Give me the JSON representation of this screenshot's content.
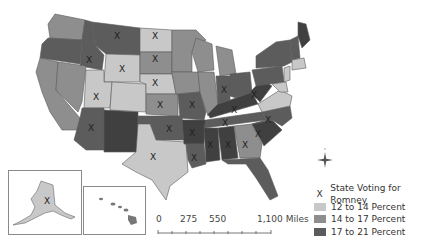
{
  "map": {
    "type": "choropleth",
    "subject": "US states by percent, with states voting for Romney marked X",
    "colors": {
      "c12_14": "#c8c8c8",
      "c14_17": "#8e8e8e",
      "c17_21": "#5c5c5c"
    },
    "x_marker": "X"
  },
  "legend": {
    "items": [
      {
        "symbol": "X",
        "label": "State Voting for Romney"
      },
      {
        "swatch": "#c8c8c8",
        "label": "12 to 14 Percent"
      },
      {
        "swatch": "#8e8e8e",
        "label": "14 to 17 Percent"
      },
      {
        "swatch": "#5c5c5c",
        "label": "17 to 21 Percent"
      }
    ]
  },
  "scale_bar": {
    "labels": [
      "0",
      "275",
      "550",
      "1,100 Miles"
    ]
  },
  "compass": {
    "icon": "compass-rose-icon"
  },
  "insets": [
    {
      "name": "Alaska",
      "romney": true
    },
    {
      "name": "Hawaii",
      "romney": false
    }
  ]
}
